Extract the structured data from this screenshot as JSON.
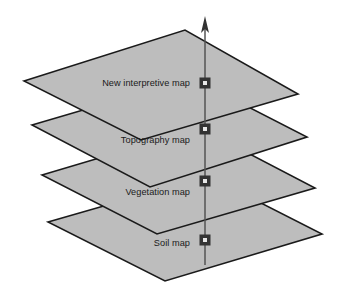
{
  "diagram": {
    "type": "layer-stack",
    "background_color": "#ffffff",
    "plane_fill_color": "#bdbdbd",
    "plane_stroke_color": "#1a1a1a",
    "axis_color": "#555555",
    "marker_outer_color": "#333333",
    "marker_inner_color": "#e8e8e8",
    "text_color": "#1a1a1a",
    "axis": {
      "name": "vertical-axis",
      "x": 205,
      "top_y": 16,
      "bottom_y": 265,
      "arrowhead": "up"
    },
    "layers": [
      {
        "id": "new-interpretive-map",
        "label": "New interpretive map",
        "order": 1,
        "label_x": 190,
        "label_y": 83,
        "marker_x": 205,
        "marker_y": 83,
        "points": "24,81 185,30 298,94 141,140"
      },
      {
        "id": "topography-map",
        "label": "Topography map",
        "order": 2,
        "label_x": 190,
        "label_y": 140,
        "marker_x": 205,
        "marker_y": 129,
        "points": "32,125 192,78 307,137 150,187"
      },
      {
        "id": "vegetation-map",
        "label": "Vegetation map",
        "order": 3,
        "label_x": 190,
        "label_y": 192,
        "marker_x": 205,
        "marker_y": 181,
        "points": "42,175 200,128 315,188 157,234"
      },
      {
        "id": "soil-map",
        "label": "Soil map",
        "order": 4,
        "label_x": 190,
        "label_y": 243,
        "marker_x": 205,
        "marker_y": 240,
        "points": "48,222 208,176 322,234 165,281"
      }
    ]
  }
}
